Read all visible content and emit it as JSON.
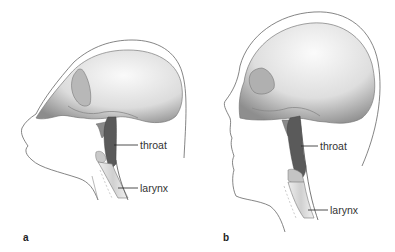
{
  "figure": {
    "panels": [
      {
        "id": "a",
        "caption": "a",
        "subject": "chimpanzee-like head with skull, throat and larynx",
        "labels": {
          "throat": "throat",
          "larynx": "larynx"
        }
      },
      {
        "id": "b",
        "caption": "b",
        "subject": "human head with skull, throat and larynx",
        "labels": {
          "throat": "throat",
          "larynx": "larynx"
        }
      }
    ],
    "colors": {
      "skull_light": "#f2f2f2",
      "skull_shade": "#9a9a9a",
      "throat": "#5a5a5a",
      "outline": "#555555",
      "larynx": "#d8d8d8"
    }
  }
}
